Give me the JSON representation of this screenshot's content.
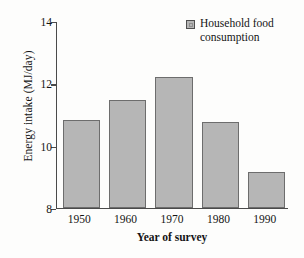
{
  "chart_data": {
    "type": "bar",
    "title": "",
    "categories": [
      "1950",
      "1960",
      "1970",
      "1980",
      "1990"
    ],
    "values": [
      10.8,
      11.45,
      12.2,
      10.75,
      9.15
    ],
    "series": [
      {
        "name": "Household food consumption",
        "values": [
          10.8,
          11.45,
          12.2,
          10.75,
          9.15
        ]
      }
    ],
    "xlabel": "Year of survey",
    "ylabel": "Energy intake (MJ/day)",
    "ylim": [
      8,
      14
    ],
    "yticks": [
      "8",
      "10",
      "12",
      "14"
    ],
    "ytick_values": [
      8,
      10,
      12,
      14
    ],
    "grid": false,
    "legend_position": "top-right",
    "legend": [
      {
        "label": "Household food consumption",
        "swatch_icon": "legend-square-icon",
        "color": "#b6b6b6"
      }
    ],
    "colors": {
      "bar_fill": "#b6b6b6",
      "bar_border": "#6d6d6d",
      "axis": "#4a4a4a",
      "text": "#141414",
      "background": "#fdfdfc"
    }
  }
}
